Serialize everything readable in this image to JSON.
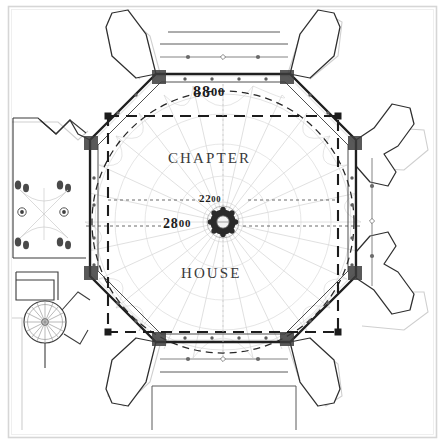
{
  "drawing": {
    "type": "architectural-floor-plan",
    "subject": "Chapter House octagonal plan with central pier",
    "room_labels": [
      {
        "text": "CHAPTER",
        "x": 168,
        "y": 158
      },
      {
        "text": "HOUSE",
        "x": 181,
        "y": 272
      }
    ],
    "dimensions": [
      {
        "id": "span-outer",
        "value": "8800",
        "int": "88",
        "zeros": "00",
        "x": 193,
        "y": 92,
        "note": "overall octagon span across flats"
      },
      {
        "id": "span-inner",
        "value": "2200",
        "int": "22",
        "zeros": "00",
        "x": 211,
        "y": 199,
        "note": "upper horizontal dimension line"
      },
      {
        "id": "span-centre",
        "value": "2800",
        "int": "28",
        "zeros": "00",
        "x": 177,
        "y": 226,
        "note": "centre-line dimension through central pier"
      }
    ],
    "elements": {
      "outer_frame": "border-rule",
      "octagon_wall": "thick-black-octagon",
      "dashed_square": "inscribed-dashed-square",
      "dashed_circle": "inscribed-dashed-circle",
      "vault_ribs": "radiating-fan-vault-ribs",
      "central_pier": "central-clustered-column",
      "buttresses": 8,
      "window_markers": "diamond-and-dot-mullion-marks",
      "stair_turret": "spiral-staircase-vice",
      "vestibule": "west-vestibule-passage"
    }
  },
  "colors": {
    "ink": "#1a1a1a",
    "wall": "#2e2e2e",
    "ghost": "#b9b9b9",
    "rib": "#c8c8c8",
    "frame": "#d6d6d6",
    "paper": "#ffffff"
  }
}
